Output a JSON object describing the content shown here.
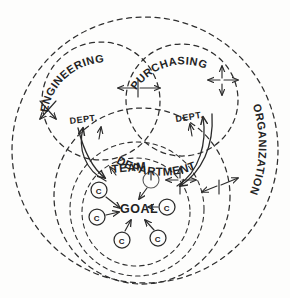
{
  "diagram": {
    "style": "hand-drawn sketch, dashed boundary circles, solid arrows",
    "ink_color": "#2b2b2b",
    "paper_color": "#fdfdfc"
  },
  "boundaries": [
    {
      "id": "organization",
      "label": "ORGANIZATION",
      "shape": "dashed-circle",
      "cx": 145,
      "cy": 150,
      "r": 133
    },
    {
      "id": "engineering",
      "label": "ENGINEERING",
      "shape": "dashed-circle",
      "cx": 101,
      "cy": 101,
      "r": 59
    },
    {
      "id": "purchasing",
      "label": "PURCHASING",
      "shape": "dashed-circle",
      "cx": 182,
      "cy": 100,
      "r": 56
    },
    {
      "id": "department",
      "label": "DEPARTMENT",
      "shape": "dashed-circle",
      "cx": 142,
      "cy": 196,
      "r": 88
    },
    {
      "id": "team",
      "label": "TEAM",
      "shape": "dashed-circle",
      "cx": 137,
      "cy": 209,
      "r": 67
    },
    {
      "id": "goal-ring",
      "label": "",
      "shape": "dashed-circle",
      "cx": 136,
      "cy": 212,
      "r": 54
    }
  ],
  "labels": {
    "engineering": "ENGINEERING",
    "purchasing": "PURCHASING",
    "organization": "ORGANIZATION",
    "department": "DEPARTMENT",
    "dept_left": "DEPT.",
    "dept_right": "DEPT.",
    "team": "TEAM",
    "goal": "GOAL"
  },
  "nodes": [
    {
      "id": "c1",
      "label": "C",
      "cx": 99,
      "cy": 190,
      "r": 8
    },
    {
      "id": "c2",
      "label": "C",
      "cx": 97,
      "cy": 217,
      "r": 8
    },
    {
      "id": "c3",
      "label": "C",
      "cx": 122,
      "cy": 240,
      "r": 8
    },
    {
      "id": "c4",
      "label": "C",
      "cx": 158,
      "cy": 238,
      "r": 8
    },
    {
      "id": "c5",
      "label": "C",
      "cx": 167,
      "cy": 207,
      "r": 8
    },
    {
      "id": "c6",
      "label": "",
      "cx": 151,
      "cy": 180,
      "r": 8
    }
  ],
  "node_arrows": [
    {
      "from": "c1",
      "to": "goal"
    },
    {
      "from": "c2",
      "to": "goal"
    },
    {
      "from": "c3",
      "to": "goal"
    },
    {
      "from": "c4",
      "to": "goal"
    },
    {
      "from": "c5",
      "to": "goal"
    },
    {
      "from": "c6",
      "to": "goal"
    }
  ],
  "boundary_arrows": [
    {
      "id": "arrow-eng-left",
      "type": "double-headed",
      "crosses": "engineering-outer",
      "x": 47,
      "y": 110
    },
    {
      "id": "arrow-eng-purchasing",
      "type": "double-headed",
      "crosses": "engineering-purchasing",
      "x": 138,
      "y": 88
    },
    {
      "id": "arrow-purchasing-right",
      "type": "multi-headed",
      "crosses": "purchasing-outer",
      "x": 222,
      "y": 80
    },
    {
      "id": "arrow-team-right",
      "type": "multi-headed",
      "crosses": "team-department",
      "x": 180,
      "y": 180
    },
    {
      "id": "arrow-dept-outer",
      "type": "double-headed",
      "crosses": "department-organization",
      "x": 219,
      "y": 185
    }
  ],
  "curved_arrows": [
    {
      "id": "curve-left-up",
      "from": "team-area",
      "to": "dept-left"
    },
    {
      "id": "curve-left-down",
      "from": "dept-left",
      "to": "team-area"
    },
    {
      "id": "curve-right-up",
      "from": "team-area",
      "to": "dept-right"
    },
    {
      "id": "curve-right-down",
      "from": "dept-right",
      "to": "team-area"
    }
  ]
}
